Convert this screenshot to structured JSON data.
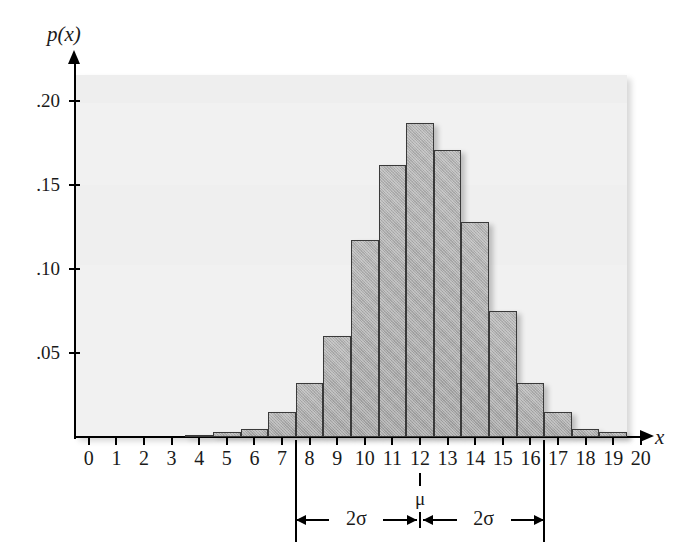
{
  "figure": {
    "background_color": "#ffffff",
    "panel_color": "#f1f1f1",
    "bar_fill": "#a8a8a8",
    "bar_stroke": "#3a3a3a"
  },
  "axis": {
    "y_name": "p(x)",
    "x_name": "x",
    "y_ticks": [
      {
        "label": ".20",
        "value": 0.2
      },
      {
        "label": ".15",
        "value": 0.15
      },
      {
        "label": ".10",
        "value": 0.1
      },
      {
        "label": ".05",
        "value": 0.05
      }
    ],
    "x_ticks": [
      "0",
      "1",
      "2",
      "3",
      "4",
      "5",
      "6",
      "7",
      "8",
      "9",
      "10",
      "11",
      "12",
      "13",
      "14",
      "15",
      "16",
      "17",
      "18",
      "19",
      "20"
    ]
  },
  "annotations": {
    "mu_label": "μ",
    "sigma_left_label": "2σ",
    "sigma_right_label": "2σ",
    "mu_x": 12,
    "left_bound_x": 7.5,
    "right_bound_x": 16.5
  },
  "chart_data": {
    "type": "bar",
    "title": "",
    "xlabel": "x",
    "ylabel": "p(x)",
    "xlim": [
      -0.5,
      20.5
    ],
    "ylim": [
      0,
      0.215
    ],
    "grid": false,
    "legend": "none",
    "categories": [
      0,
      1,
      2,
      3,
      4,
      5,
      6,
      7,
      8,
      9,
      10,
      11,
      12,
      13,
      14,
      15,
      16,
      17,
      18,
      19,
      20
    ],
    "values": [
      0,
      0,
      0,
      0,
      0.001,
      0.003,
      0.005,
      0.015,
      0.032,
      0.06,
      0.117,
      0.162,
      0.187,
      0.171,
      0.128,
      0.075,
      0.032,
      0.015,
      0.005,
      0.003,
      0.0
    ],
    "series": [
      {
        "name": "p(x)",
        "values": [
          0,
          0,
          0,
          0,
          0.001,
          0.003,
          0.005,
          0.015,
          0.032,
          0.06,
          0.117,
          0.162,
          0.187,
          0.171,
          0.128,
          0.075,
          0.032,
          0.015,
          0.005,
          0.003,
          0.0
        ]
      }
    ]
  }
}
